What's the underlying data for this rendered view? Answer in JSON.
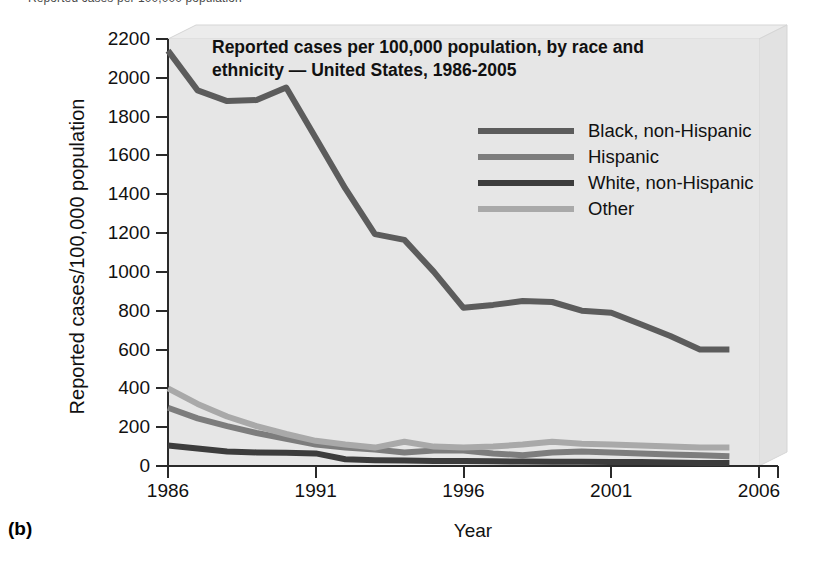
{
  "panel_letter": "(b)",
  "clipped_header_text": "Reported cases per 100,000 population",
  "chart_data": {
    "type": "line",
    "title": "Reported cases per 100,000 population, by race and\nethnicity — United States, 1986-2005",
    "xlabel": "Year",
    "ylabel": "Reported cases/100,000 population",
    "grid": false,
    "legend_position": "upper-right-inside",
    "xlim": [
      1986,
      2006
    ],
    "ylim": [
      0,
      2200
    ],
    "xticks": [
      1986,
      1991,
      1996,
      2001,
      2006
    ],
    "xtick_labels": [
      "1986",
      "1991",
      "1996",
      "2001",
      "2006"
    ],
    "yticks": [
      0,
      200,
      400,
      600,
      800,
      1000,
      1200,
      1400,
      1600,
      1800,
      2000,
      2200
    ],
    "ytick_labels": [
      "0",
      "200",
      "400",
      "600",
      "800",
      "1000",
      "1200",
      "1400",
      "1600",
      "1800",
      "2000",
      "2200"
    ],
    "x": [
      1986,
      1987,
      1988,
      1989,
      1990,
      1991,
      1992,
      1993,
      1994,
      1995,
      1996,
      1997,
      1998,
      1999,
      2000,
      2001,
      2002,
      2003,
      2004,
      2005
    ],
    "series": [
      {
        "name": "Black, non-Hispanic",
        "color": "#5c5c5c",
        "values": [
          2140,
          1935,
          1880,
          1885,
          1950,
          1690,
          1430,
          1195,
          1165,
          1000,
          815,
          830,
          850,
          845,
          800,
          790,
          730,
          670,
          600,
          600
        ]
      },
      {
        "name": "Hispanic",
        "color": "#7d7d7d",
        "values": [
          300,
          245,
          205,
          170,
          140,
          110,
          95,
          85,
          70,
          80,
          80,
          65,
          55,
          70,
          75,
          70,
          65,
          60,
          55,
          50
        ]
      },
      {
        "name": "White, non-Hispanic",
        "color": "#3c3c3c",
        "values": [
          105,
          90,
          75,
          70,
          68,
          65,
          35,
          30,
          28,
          26,
          25,
          24,
          23,
          22,
          22,
          21,
          20,
          18,
          16,
          15
        ]
      },
      {
        "name": "Other",
        "color": "#a9a9a9",
        "values": [
          400,
          320,
          255,
          205,
          165,
          130,
          110,
          95,
          125,
          100,
          95,
          100,
          110,
          125,
          115,
          110,
          105,
          100,
          95,
          95
        ]
      }
    ]
  }
}
